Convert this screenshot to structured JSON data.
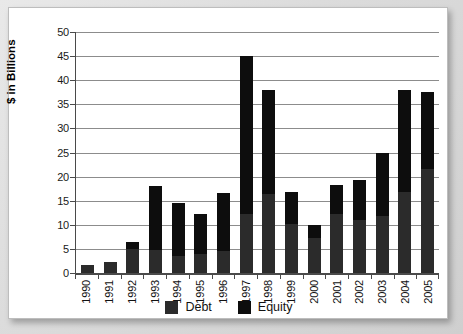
{
  "chart_data": {
    "type": "bar",
    "subtype": "stacked-vertical-bar",
    "title": "",
    "xlabel": "",
    "ylabel": "$ in Billions",
    "ylim": [
      0,
      50
    ],
    "ytick_step": 5,
    "ytick_labels": [
      "50",
      "45",
      "40",
      "35",
      "30",
      "25",
      "20",
      "15",
      "10",
      "5",
      "0"
    ],
    "ytick_values": [
      50,
      45,
      40,
      35,
      30,
      25,
      20,
      15,
      10,
      5,
      0
    ],
    "grid": true,
    "grid_axis": "y",
    "legend_position": "bottom-center",
    "categories": [
      "1990",
      "1991",
      "1992",
      "1993",
      "1994",
      "1995",
      "1996",
      "1997",
      "1998",
      "1999",
      "2000",
      "2001",
      "2002",
      "2003",
      "2004",
      "2005"
    ],
    "series": [
      {
        "name": "Debt",
        "color": "#2b2b2b",
        "values": [
          1.7,
          2.2,
          4.9,
          4.8,
          3.6,
          4.0,
          4.6,
          12.3,
          16.4,
          10.2,
          7.2,
          12.3,
          11.0,
          11.8,
          16.9,
          21.6
        ]
      },
      {
        "name": "Equity",
        "color": "#0d0d0d",
        "values": [
          0.0,
          0.0,
          1.6,
          13.2,
          10.9,
          8.2,
          12.1,
          32.7,
          21.6,
          6.6,
          2.8,
          6.0,
          8.3,
          13.2,
          21.1,
          16.0
        ]
      }
    ],
    "totals": [
      1.7,
      2.2,
      6.5,
      18.0,
      14.5,
      12.2,
      16.7,
      45.0,
      38.0,
      16.8,
      10.0,
      18.3,
      19.3,
      25.0,
      38.0,
      37.6
    ]
  },
  "axes": {
    "y_title": "$ in Billions"
  },
  "legend": {
    "items": [
      {
        "label": "Debt",
        "swatch": "legend-swatch-debt"
      },
      {
        "label": "Equity",
        "swatch": "legend-swatch-equity"
      }
    ]
  },
  "colors": {
    "debt": "#2b2b2b",
    "equity": "#0d0d0d",
    "gridline": "#8c8c8c",
    "axis": "#4a4a4a",
    "plot_background": "#ffffff",
    "page_background": "#d8d8d8"
  }
}
